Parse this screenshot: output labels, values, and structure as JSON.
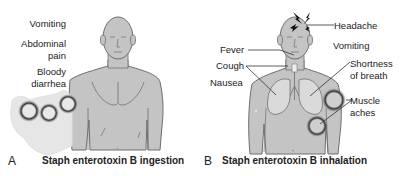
{
  "panels": [
    {
      "letter": "A",
      "caption": "Staph enterotoxin B ingestion",
      "labels": {
        "vomiting": "Vomiting",
        "abdominal_1": "Abdominal",
        "abdominal_2": "pain",
        "bloody_1": "Bloody",
        "bloody_2": "diarrhea"
      }
    },
    {
      "letter": "B",
      "caption": "Staph enterotoxin B inhalation",
      "labels": {
        "headache": "Headache",
        "fever": "Fever",
        "vomiting": "Vomiting",
        "cough": "Cough",
        "shortness_1": "Shortness",
        "shortness_2": "of breath",
        "nausea": "Nausea",
        "muscle_1": "Muscle",
        "muscle_2": "aches"
      }
    }
  ],
  "colors": {
    "body_fill": "#c4c4c4",
    "body_stroke": "#6e6e6e",
    "lung_fill": "#d9d9d9",
    "intestine_fill": "#e6e6e6",
    "highlight_ring": "#3a3a3a"
  }
}
